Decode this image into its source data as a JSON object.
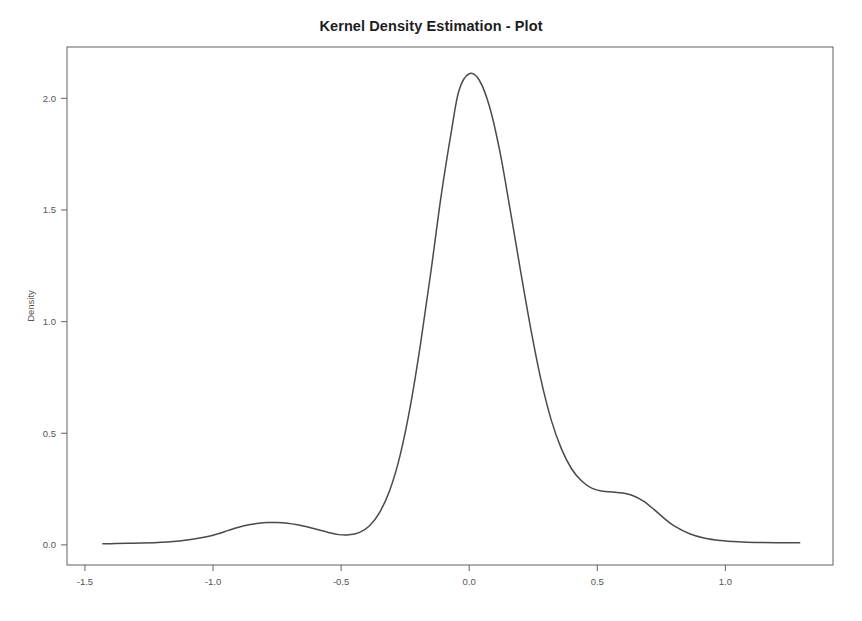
{
  "chart_data": {
    "type": "line",
    "title": "Kernel Density Estimation - Plot",
    "xlabel": "",
    "ylabel": "Density",
    "xlim": [
      -1.57,
      1.42
    ],
    "ylim": [
      -0.09,
      2.23
    ],
    "grid": false,
    "legend": null,
    "xticks": [
      -1.5,
      -1.0,
      -0.5,
      0.0,
      0.5,
      1.0
    ],
    "xticklabels": [
      "-1.5",
      "-1.0",
      "-0.5",
      "0.0",
      "0.5",
      "1.0"
    ],
    "yticks": [
      0.0,
      0.5,
      1.0,
      1.5,
      2.0
    ],
    "yticklabels": [
      "0.0",
      "0.5",
      "1.0",
      "1.5",
      "2.0"
    ],
    "annotations": [
      "main mode at x = 0.00, density = 2.11",
      "secondary bump at x = -0.75, density = 0.10",
      "right shoulder at x = 0.52, density = 0.24"
    ],
    "series": [
      {
        "name": "Density",
        "color": "#4a4a4a",
        "x": [
          -1.43,
          -1.38,
          -1.33,
          -1.28,
          -1.23,
          -1.18,
          -1.13,
          -1.08,
          -1.03,
          -0.98,
          -0.94,
          -0.9,
          -0.86,
          -0.82,
          -0.79,
          -0.75,
          -0.71,
          -0.67,
          -0.63,
          -0.59,
          -0.55,
          -0.51,
          -0.47,
          -0.43,
          -0.39,
          -0.35,
          -0.31,
          -0.27,
          -0.23,
          -0.19,
          -0.15,
          -0.11,
          -0.07,
          -0.04,
          0.0,
          0.04,
          0.08,
          0.12,
          0.16,
          0.2,
          0.24,
          0.28,
          0.32,
          0.36,
          0.4,
          0.44,
          0.48,
          0.52,
          0.56,
          0.6,
          0.64,
          0.68,
          0.72,
          0.76,
          0.8,
          0.86,
          0.92,
          0.98,
          1.05,
          1.12,
          1.2,
          1.29
        ],
        "y": [
          0.005,
          0.006,
          0.007,
          0.008,
          0.01,
          0.013,
          0.018,
          0.025,
          0.035,
          0.05,
          0.065,
          0.079,
          0.09,
          0.097,
          0.1,
          0.1,
          0.097,
          0.09,
          0.08,
          0.068,
          0.056,
          0.046,
          0.045,
          0.055,
          0.085,
          0.145,
          0.245,
          0.4,
          0.62,
          0.9,
          1.22,
          1.56,
          1.85,
          2.035,
          2.11,
          2.08,
          1.96,
          1.76,
          1.5,
          1.23,
          0.97,
          0.74,
          0.56,
          0.43,
          0.34,
          0.285,
          0.253,
          0.24,
          0.237,
          0.232,
          0.22,
          0.196,
          0.16,
          0.12,
          0.085,
          0.05,
          0.03,
          0.02,
          0.014,
          0.011,
          0.01,
          0.01
        ]
      }
    ]
  },
  "axes": {
    "y_axis_title": "Density"
  }
}
